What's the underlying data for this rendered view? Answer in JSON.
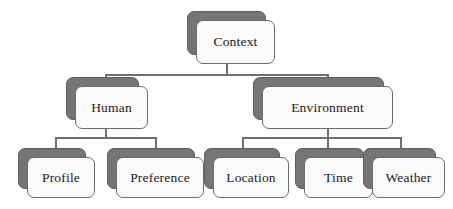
{
  "diagram": {
    "type": "hierarchy-tree",
    "background_color": "#ffffff",
    "node_fill_color": "#fbfbfb",
    "node_shadow_color": "#757575",
    "node_border_color": "#6b6b6b",
    "connector_color": "#6f6f6f",
    "text_color": "#1a1a1a",
    "levels": 3,
    "nodes": {
      "root": {
        "label": "Context"
      },
      "human": {
        "label": "Human"
      },
      "environment": {
        "label": "Environment"
      },
      "profile": {
        "label": "Profile"
      },
      "preference": {
        "label": "Preference"
      },
      "location": {
        "label": "Location"
      },
      "time": {
        "label": "Time"
      },
      "weather": {
        "label": "Weather"
      }
    },
    "edges": [
      {
        "from": "Context",
        "to": "Human"
      },
      {
        "from": "Context",
        "to": "Environment"
      },
      {
        "from": "Human",
        "to": "Profile"
      },
      {
        "from": "Human",
        "to": "Preference"
      },
      {
        "from": "Environment",
        "to": "Location"
      },
      {
        "from": "Environment",
        "to": "Time"
      },
      {
        "from": "Environment",
        "to": "Weather"
      }
    ]
  }
}
